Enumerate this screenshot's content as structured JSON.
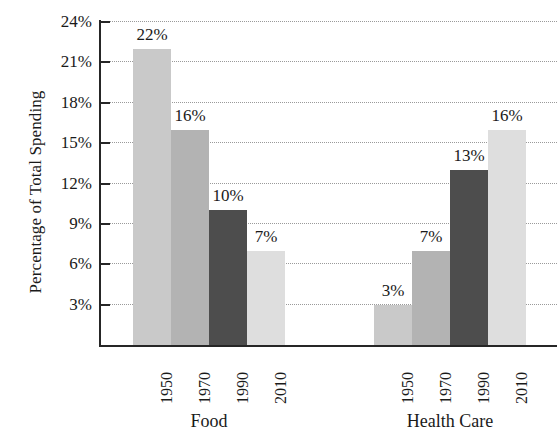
{
  "chart_data": {
    "type": "bar",
    "title": "",
    "xlabel": "",
    "ylabel": "Percentage of Total Spending",
    "ylim": [
      0,
      24
    ],
    "grid": true,
    "legend": "none",
    "categories": [
      "1950",
      "1970",
      "1990",
      "2010"
    ],
    "groups": [
      {
        "name": "Food",
        "values": [
          22,
          16,
          10,
          7
        ],
        "labels": [
          "22%",
          "16%",
          "10%",
          "7%"
        ]
      },
      {
        "name": "Health Care",
        "values": [
          3,
          7,
          13,
          16
        ],
        "labels": [
          "3%",
          "7%",
          "13%",
          "16%"
        ]
      }
    ],
    "y_ticks": [
      3,
      6,
      9,
      12,
      15,
      18,
      21,
      24
    ],
    "y_tick_labels": [
      "3%",
      "6%",
      "9%",
      "12%",
      "15%",
      "18%",
      "21%",
      "24%"
    ],
    "bar_colors": [
      "#c9c9c9",
      "#b3b3b3",
      "#4d4d4d",
      "#dedede"
    ],
    "axis_color": "#262626",
    "grid_color": "#9a9a9a",
    "text_color": "#1a1a1a"
  },
  "axis": {
    "y_title": "Percentage of Total Spending"
  }
}
